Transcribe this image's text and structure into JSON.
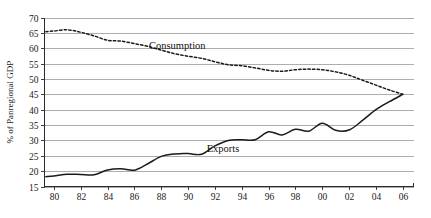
{
  "chart_data": {
    "type": "line",
    "title": "",
    "xlabel": "",
    "ylabel": "% of Panregional GDP",
    "xlim": [
      1979.3,
      2006.8
    ],
    "ylim": [
      15,
      70
    ],
    "grid": true,
    "legend_position": "inline",
    "y_ticks": [
      70,
      65,
      60,
      55,
      50,
      45,
      40,
      35,
      30,
      25,
      20,
      15
    ],
    "y_tick_labels": [
      "70",
      "65",
      "60",
      "55",
      "50",
      "45",
      "40",
      "35",
      "30",
      "25",
      "20",
      "15"
    ],
    "x_ticks": [
      1980,
      1982,
      1984,
      1986,
      1988,
      1990,
      1992,
      1994,
      1996,
      1998,
      2000,
      2002,
      2004,
      2006
    ],
    "x_tick_labels": [
      "80",
      "82",
      "84",
      "86",
      "88",
      "90",
      "92",
      "94",
      "96",
      "98",
      "00",
      "02",
      "04",
      "06"
    ],
    "x": [
      1979.4,
      1980,
      1981,
      1982,
      1983,
      1984,
      1985,
      1986,
      1987,
      1988,
      1989,
      1990,
      1991,
      1992,
      1993,
      1994,
      1995,
      1996,
      1997,
      1998,
      1999,
      2000,
      2001,
      2002,
      2003,
      2004,
      2005,
      2006
    ],
    "series": [
      {
        "name": "Consumption",
        "style": "dashed",
        "color": "#1a1a1a",
        "label_x": 1989.2,
        "label_y": 59.6,
        "values": [
          65.4,
          65.6,
          66.0,
          65.2,
          64.0,
          62.6,
          62.3,
          61.5,
          60.6,
          59.4,
          58.2,
          57.4,
          56.7,
          55.6,
          54.6,
          54.3,
          53.6,
          52.8,
          52.5,
          53.0,
          53.2,
          53.0,
          52.3,
          51.2,
          49.6,
          48.0,
          46.4,
          45.0
        ]
      },
      {
        "name": "Exports",
        "style": "solid",
        "color": "#1a1a1a",
        "label_x": 1992.6,
        "label_y": 26.2,
        "values": [
          18.2,
          18.4,
          19.0,
          18.9,
          18.8,
          20.4,
          20.8,
          20.3,
          22.4,
          24.8,
          25.6,
          25.7,
          25.5,
          28.2,
          30.0,
          30.2,
          30.2,
          32.8,
          31.8,
          33.6,
          33.0,
          35.6,
          33.3,
          33.4,
          36.5,
          40.0,
          42.6,
          45.0
        ]
      }
    ]
  },
  "axis": {
    "y_title": "% of Panregional GDP"
  }
}
